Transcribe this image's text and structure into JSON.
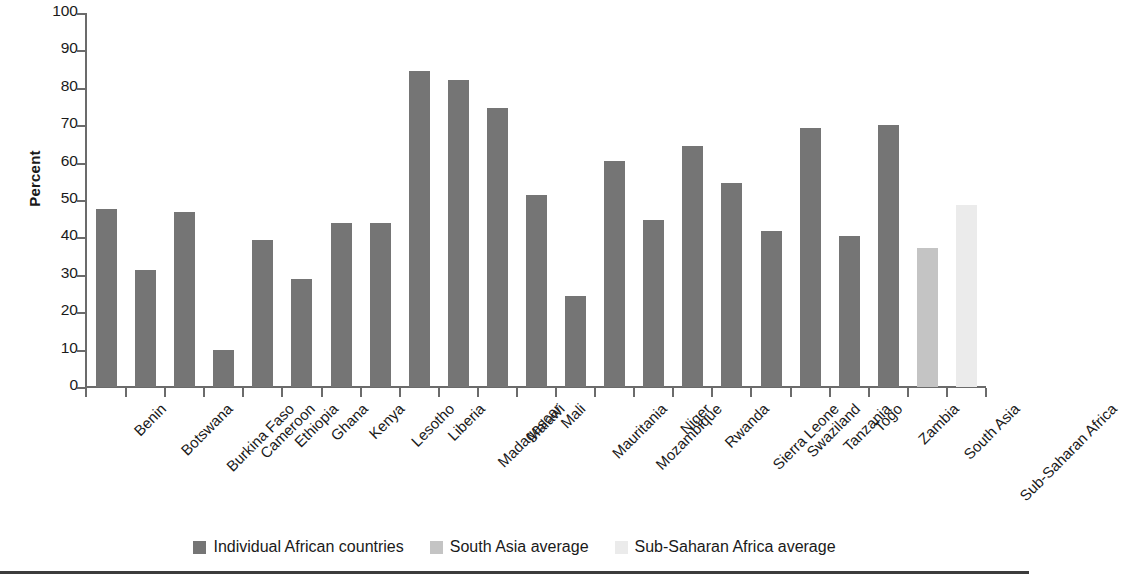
{
  "chart_data": {
    "type": "bar",
    "title": "",
    "xlabel": "",
    "ylabel": "Percent",
    "ylim": [
      0,
      100
    ],
    "yticks": [
      0,
      10,
      20,
      30,
      40,
      50,
      60,
      70,
      80,
      90,
      100
    ],
    "grid": false,
    "legend_position": "bottom",
    "categories": [
      "Benin",
      "Botswana",
      "Burkina Faso",
      "Cameroon",
      "Ethiopia",
      "Ghana",
      "Kenya",
      "Lesotho",
      "Liberia",
      "Madagascar",
      "Malawi",
      "Mali",
      "Mauritania",
      "Mozambique",
      "Niger",
      "Rwanda",
      "Sierra Leone",
      "Swaziland",
      "Tanzania",
      "Togo",
      "Zambia",
      "South Asia",
      "Sub-Saharan Africa"
    ],
    "values": [
      47.5,
      31.4,
      46.8,
      9.9,
      39.3,
      28.9,
      43.9,
      43.9,
      84.5,
      82.1,
      74.6,
      51.3,
      24.3,
      60.4,
      44.7,
      64.4,
      54.5,
      41.8,
      69.3,
      40.3,
      70.1,
      37.3,
      48.8
    ],
    "bar_groups": [
      "individual",
      "individual",
      "individual",
      "individual",
      "individual",
      "individual",
      "individual",
      "individual",
      "individual",
      "individual",
      "individual",
      "individual",
      "individual",
      "individual",
      "individual",
      "individual",
      "individual",
      "individual",
      "individual",
      "individual",
      "individual",
      "south_asia",
      "sub_saharan"
    ],
    "legend": [
      {
        "key": "individual",
        "label": "Individual African countries",
        "color": "#757575"
      },
      {
        "key": "south_asia",
        "label": "South Asia average",
        "color": "#c4c4c4"
      },
      {
        "key": "sub_saharan",
        "label": "Sub-Saharan Africa average",
        "color": "#ebebeb"
      }
    ],
    "colors": {
      "individual": "#757575",
      "south_asia": "#c4c4c4",
      "sub_saharan": "#ebebeb",
      "axis": "#6b6b6b",
      "text": "#1a1a1a"
    }
  }
}
